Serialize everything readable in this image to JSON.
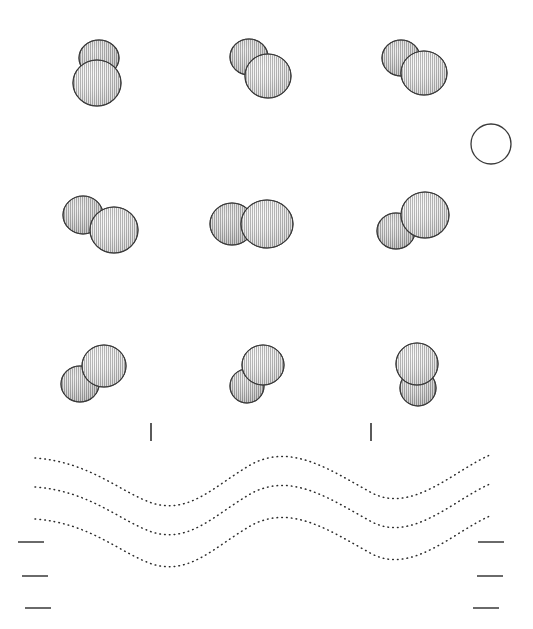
{
  "figure": {
    "title": "Binary sphere interaction sequence",
    "background_color": "#ffffff",
    "ink_color": "#2b2b2b",
    "width": 533,
    "height": 629,
    "sphere_fill_light": "#d8d8d8",
    "sphere_fill_dark": "#9a9a9a",
    "sphere_outline": "#333333"
  },
  "reference_circle": {
    "label": "reference-circle",
    "cx": 491,
    "cy": 144,
    "r": 20,
    "stroke": "#3a3a3a",
    "stroke_width": 1.3,
    "fill": "none"
  },
  "rows": [
    {
      "name": "row-1",
      "panels": [
        {
          "name": "panel-1-1",
          "orientation_deg": 90,
          "spheres": [
            {
              "cx": 99,
              "cy": 58,
              "rx": 20,
              "ry": 18,
              "shade": "dark"
            },
            {
              "cx": 97,
              "cy": 83,
              "rx": 24,
              "ry": 23,
              "shade": "light"
            }
          ]
        },
        {
          "name": "panel-1-2",
          "orientation_deg": 40,
          "spheres": [
            {
              "cx": 249,
              "cy": 57,
              "rx": 19,
              "ry": 18,
              "shade": "dark"
            },
            {
              "cx": 268,
              "cy": 76,
              "rx": 23,
              "ry": 22,
              "shade": "light"
            }
          ]
        },
        {
          "name": "panel-1-3",
          "orientation_deg": 33,
          "spheres": [
            {
              "cx": 401,
              "cy": 58,
              "rx": 19,
              "ry": 18,
              "shade": "dark"
            },
            {
              "cx": 424,
              "cy": 73,
              "rx": 23,
              "ry": 22,
              "shade": "light"
            }
          ]
        }
      ]
    },
    {
      "name": "row-2",
      "panels": [
        {
          "name": "panel-2-1",
          "orientation_deg": 22,
          "spheres": [
            {
              "cx": 83,
              "cy": 215,
              "rx": 20,
              "ry": 19,
              "shade": "dark"
            },
            {
              "cx": 114,
              "cy": 230,
              "rx": 24,
              "ry": 23,
              "shade": "light"
            }
          ]
        },
        {
          "name": "panel-2-2",
          "orientation_deg": 0,
          "spheres": [
            {
              "cx": 232,
              "cy": 224,
              "rx": 22,
              "ry": 21,
              "shade": "dark"
            },
            {
              "cx": 267,
              "cy": 224,
              "rx": 26,
              "ry": 24,
              "shade": "light"
            }
          ]
        },
        {
          "name": "panel-2-3",
          "orientation_deg": 28,
          "spheres": [
            {
              "cx": 396,
              "cy": 231,
              "rx": 19,
              "ry": 18,
              "shade": "dark"
            },
            {
              "cx": 425,
              "cy": 215,
              "rx": 24,
              "ry": 23,
              "shade": "light"
            }
          ]
        }
      ]
    },
    {
      "name": "row-3",
      "panels": [
        {
          "name": "panel-3-1",
          "orientation_deg": 38,
          "spheres": [
            {
              "cx": 80,
              "cy": 384,
              "rx": 19,
              "ry": 18,
              "shade": "dark"
            },
            {
              "cx": 104,
              "cy": 366,
              "rx": 22,
              "ry": 21,
              "shade": "light"
            }
          ]
        },
        {
          "name": "panel-3-2",
          "orientation_deg": 48,
          "spheres": [
            {
              "cx": 247,
              "cy": 386,
              "rx": 17,
              "ry": 17,
              "shade": "dark"
            },
            {
              "cx": 263,
              "cy": 365,
              "rx": 21,
              "ry": 20,
              "shade": "light"
            }
          ]
        },
        {
          "name": "panel-3-3",
          "orientation_deg": 80,
          "spheres": [
            {
              "cx": 418,
              "cy": 388,
              "rx": 18,
              "ry": 18,
              "shade": "dark"
            },
            {
              "cx": 417,
              "cy": 364,
              "rx": 21,
              "ry": 21,
              "shade": "light"
            }
          ]
        }
      ]
    }
  ],
  "tick_marks": [
    {
      "name": "tick-left",
      "x": 150,
      "y": 423,
      "width": 1.6,
      "height": 18
    },
    {
      "name": "tick-right",
      "x": 370,
      "y": 423,
      "width": 1.6,
      "height": 18
    }
  ],
  "scale_dashes": {
    "left": [
      {
        "name": "scale-dash-left-1",
        "x": 18,
        "y": 541,
        "width": 26
      },
      {
        "name": "scale-dash-left-2",
        "x": 22,
        "y": 575,
        "width": 26
      },
      {
        "name": "scale-dash-left-3",
        "x": 25,
        "y": 607,
        "width": 26
      }
    ],
    "right": [
      {
        "name": "scale-dash-right-1",
        "x": 478,
        "y": 541,
        "width": 26
      },
      {
        "name": "scale-dash-right-2",
        "x": 477,
        "y": 575,
        "width": 26
      },
      {
        "name": "scale-dash-right-3",
        "x": 473,
        "y": 607,
        "width": 26
      }
    ]
  },
  "chart_data": {
    "type": "line",
    "xlabel": "",
    "ylabel": "",
    "xlim": [
      35,
      492
    ],
    "ylim": [
      450,
      590
    ],
    "grid": false,
    "legend": "none",
    "note": "Three parallel dotted wave contours; trough near x=150, crest near x=255, trough near x=375.",
    "series": [
      {
        "name": "wave-1",
        "path": "M 35 458 C 90 462, 120 492, 152 503 C 190 515, 215 485, 252 464 C 292 443, 330 470, 372 493 C 412 514, 455 470, 490 455",
        "stroke": "#2b2b2b"
      },
      {
        "name": "wave-2",
        "path": "M 35 487 C 90 491, 120 521, 152 532 C 190 544, 215 514, 252 493 C 292 472, 330 499, 372 522 C 412 543, 455 499, 490 484",
        "stroke": "#2b2b2b"
      },
      {
        "name": "wave-3",
        "path": "M 35 519 C 90 523, 120 553, 152 564 C 190 576, 215 546, 252 525 C 292 504, 330 531, 372 554 C 412 575, 455 531, 490 516",
        "stroke": "#2b2b2b"
      }
    ]
  }
}
